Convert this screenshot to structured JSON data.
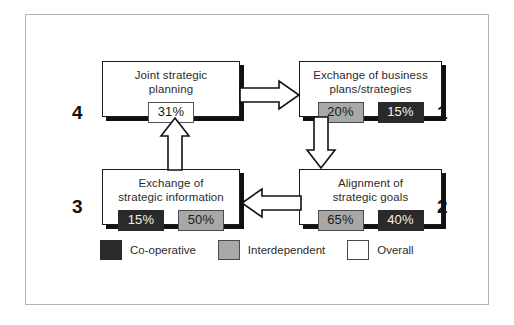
{
  "diagram": {
    "boxes": [
      {
        "id": "top-left",
        "title": "Joint strategic\nplanning",
        "quadrant": "4",
        "chips": [
          {
            "value": "31%",
            "series": "Overall"
          }
        ]
      },
      {
        "id": "top-right",
        "title": "Exchange of business\nplans/strategies",
        "quadrant": "1",
        "chips": [
          {
            "value": "20%",
            "series": "Interdependent"
          },
          {
            "value": "15%",
            "series": "Co-operative"
          }
        ]
      },
      {
        "id": "bottom-left",
        "title": "Exchange of\nstrategic information",
        "quadrant": "3",
        "chips": [
          {
            "value": "15%",
            "series": "Co-operative"
          },
          {
            "value": "50%",
            "series": "Interdependent"
          }
        ]
      },
      {
        "id": "bottom-right",
        "title": "Alignment of\nstrategic goals",
        "quadrant": "2",
        "chips": [
          {
            "value": "65%",
            "series": "Interdependent"
          },
          {
            "value": "40%",
            "series": "Co-operative"
          }
        ]
      }
    ],
    "quadrant_numbers": {
      "top_left": "4",
      "top_right": "1",
      "bottom_left": "3",
      "bottom_right": "2"
    },
    "arrows": [
      {
        "name": "top-arrow-right",
        "direction": "right"
      },
      {
        "name": "right-arrow-down",
        "direction": "down"
      },
      {
        "name": "bottom-arrow-left",
        "direction": "left"
      },
      {
        "name": "left-arrow-up",
        "direction": "up"
      }
    ]
  },
  "legend": {
    "items": [
      {
        "label": "Co-operative",
        "color": "#2a2a2a"
      },
      {
        "label": "Interdependent",
        "color": "#a8a8a8"
      },
      {
        "label": "Overall",
        "color": "#ffffff"
      }
    ]
  },
  "colors": {
    "co_operative": "#2a2a2a",
    "interdependent": "#a8a8a8",
    "overall": "#ffffff",
    "box_border": "#1a1a1a",
    "frame_border": "#b4b4b4"
  }
}
